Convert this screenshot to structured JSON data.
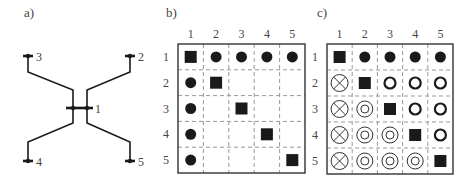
{
  "panels": {
    "a": {
      "label": "a)",
      "nodes": [
        {
          "id": "1",
          "label": "1",
          "x": 80,
          "y": 108
        },
        {
          "id": "2",
          "label": "2",
          "x": 130,
          "y": 56
        },
        {
          "id": "3",
          "label": "3",
          "x": 28,
          "y": 56
        },
        {
          "id": "4",
          "label": "4",
          "x": 28,
          "y": 161
        },
        {
          "id": "5",
          "label": "5",
          "x": 130,
          "y": 161
        }
      ]
    },
    "b": {
      "label": "b)",
      "col_labels": [
        "1",
        "2",
        "3",
        "4",
        "5"
      ],
      "row_labels": [
        "1",
        "2",
        "3",
        "4",
        "5"
      ],
      "cells": [
        [
          "square",
          "dot",
          "dot",
          "dot",
          "dot"
        ],
        [
          "dot",
          "square",
          "",
          "",
          ""
        ],
        [
          "dot",
          "",
          "square",
          "",
          ""
        ],
        [
          "dot",
          "",
          "",
          "square",
          ""
        ],
        [
          "dot",
          "",
          "",
          "",
          "square"
        ]
      ]
    },
    "c": {
      "label": "c)",
      "col_labels": [
        "1",
        "2",
        "3",
        "4",
        "5"
      ],
      "row_labels": [
        "1",
        "2",
        "3",
        "4",
        "5"
      ],
      "cells": [
        [
          "square",
          "dot",
          "dot",
          "dot",
          "dot"
        ],
        [
          "crossed-circle",
          "square",
          "ring",
          "ring",
          "ring"
        ],
        [
          "crossed-circle",
          "double-ring",
          "square",
          "ring",
          "ring"
        ],
        [
          "crossed-circle",
          "double-ring",
          "double-ring",
          "square",
          "ring"
        ],
        [
          "crossed-circle",
          "double-ring",
          "double-ring",
          "double-ring",
          "square"
        ]
      ]
    }
  },
  "colors": {
    "ink": "#1a1a1a",
    "grid_dash": "#999999",
    "label": "#444444"
  }
}
